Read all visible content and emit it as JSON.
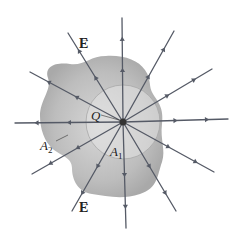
{
  "labels": {
    "field_top": "E",
    "field_bottom": "E",
    "charge": "Q",
    "surface_outer": "A",
    "surface_outer_sub": "2",
    "surface_inner": "A",
    "surface_inner_sub": "1",
    "vector_mark": "→"
  },
  "colors": {
    "background": "#ffffff",
    "blob_fill_outer": "#b4b4b4",
    "blob_fill_inner": "#d6d6d6",
    "sphere_fill": "#e6e6e6",
    "sphere_stroke": "#a8a8a8",
    "field_line": "#555a66",
    "charge": "#333333"
  },
  "charge": {
    "x": 123,
    "y": 122,
    "r": 3.5
  },
  "sphere_radius": 37,
  "field_lines": [
    {
      "x2": 122,
      "y2": 18
    },
    {
      "x2": 174,
      "y2": 31
    },
    {
      "x2": 212,
      "y2": 69
    },
    {
      "x2": 228,
      "y2": 119
    },
    {
      "x2": 214,
      "y2": 172
    },
    {
      "x2": 176,
      "y2": 211
    },
    {
      "x2": 126,
      "y2": 228
    },
    {
      "x2": 72,
      "y2": 211
    },
    {
      "x2": 32,
      "y2": 174
    },
    {
      "x2": 15,
      "y2": 123
    },
    {
      "x2": 30,
      "y2": 72
    },
    {
      "x2": 68,
      "y2": 33
    }
  ]
}
